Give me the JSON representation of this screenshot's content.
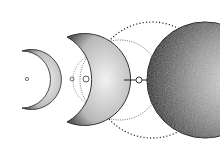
{
  "image": {
    "description": "Moon phases illustration: small crescent, larger crescent, dotted orbit circles, full dark-textured moon",
    "colors": {
      "background": "#ffffff",
      "ink": "#1a1a1a",
      "mid": "#8a8a8a",
      "light": "#cfcfcf"
    }
  }
}
